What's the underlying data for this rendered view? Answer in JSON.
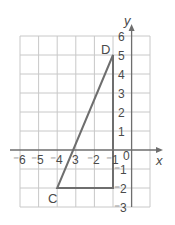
{
  "diagram": {
    "type": "coordinate-grid",
    "axes": {
      "x_label": "x",
      "y_label": "y",
      "x_range": [
        -6,
        1
      ],
      "y_range": [
        -3,
        6
      ],
      "x_ticks": [
        "⁻6",
        "⁻5",
        "⁻4",
        "3",
        "⁻2",
        "⁻1"
      ],
      "origin_label": "0",
      "y_ticks": [
        "6",
        "5",
        "4",
        "3",
        "2",
        "1",
        "⁻1",
        "⁻2",
        "⁻3"
      ]
    },
    "points": [
      {
        "label": "D",
        "x": -1,
        "y": 5
      },
      {
        "label": "C",
        "x": -4,
        "y": -2
      }
    ],
    "triangle_vertices": [
      [
        -1,
        5
      ],
      [
        -4,
        -2
      ],
      [
        -1,
        -2
      ]
    ],
    "colors": {
      "grid": "#c8c8c8",
      "axis": "#6e6e6e",
      "shape": "#6e6e6e",
      "text": "#4a4a4a"
    }
  }
}
